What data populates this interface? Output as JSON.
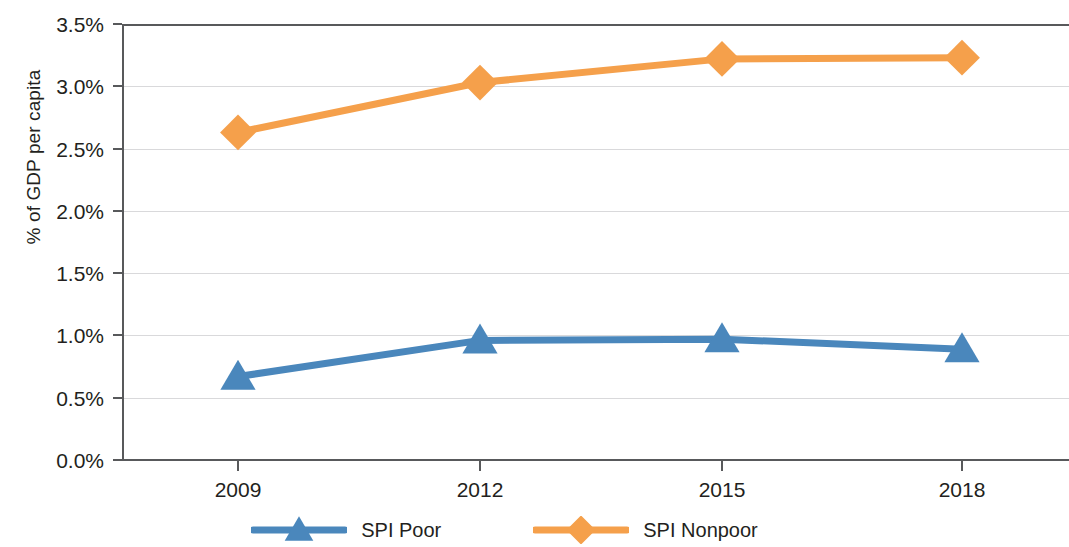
{
  "chart_data": {
    "type": "line",
    "title": "",
    "xlabel": "",
    "ylabel": "% of GDP per capita",
    "categories": [
      "2009",
      "2012",
      "2015",
      "2018"
    ],
    "x": [
      2009,
      2012,
      2015,
      2018
    ],
    "series": [
      {
        "name": "SPI Poor",
        "color": "#4a87bc",
        "marker": "triangle",
        "values": [
          0.67,
          0.96,
          0.97,
          0.89
        ]
      },
      {
        "name": "SPI Nonpoor",
        "color": "#f5a04b",
        "marker": "diamond",
        "values": [
          2.63,
          3.03,
          3.22,
          3.23
        ]
      }
    ],
    "ylim": [
      0.0,
      3.5
    ],
    "ytick_values": [
      0.0,
      0.5,
      1.0,
      1.5,
      2.0,
      2.5,
      3.0,
      3.5
    ],
    "ytick_labels": [
      "0.0%",
      "0.5%",
      "1.0%",
      "1.5%",
      "2.0%",
      "2.5%",
      "3.0%",
      "3.5%"
    ],
    "grid": true,
    "grid_axis": "y",
    "legend_position": "bottom",
    "axis_color": "#58595b",
    "gridline_color": "#d9d9db"
  },
  "y_axis": {
    "title": "% of GDP per capita"
  },
  "legend": {
    "items": [
      {
        "label": "SPI Poor",
        "color": "#4a87bc",
        "marker": "triangle"
      },
      {
        "label": "SPI Nonpoor",
        "color": "#f5a04b",
        "marker": "diamond"
      }
    ]
  }
}
